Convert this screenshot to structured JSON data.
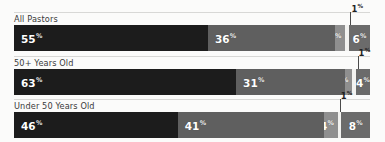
{
  "chart_data": {
    "type": "bar",
    "orientation": "horizontal",
    "stacked": true,
    "normalized": true,
    "title": "",
    "subtitle": "",
    "xlabel": "",
    "ylabel": "",
    "xlim": [
      0,
      100
    ],
    "grid": false,
    "legend": null,
    "legend_position": "none",
    "categories": [
      "All Pastors",
      "50+ Years Old",
      "Under 50 Years Old"
    ],
    "series": [
      {
        "name": "segment-1",
        "values": [
          55,
          63,
          46
        ],
        "color": "#1c1c1c"
      },
      {
        "name": "segment-2",
        "values": [
          36,
          31,
          41
        ],
        "color": "#5f5f5f"
      },
      {
        "name": "segment-3",
        "values": [
          3,
          2,
          4
        ],
        "color": "#8f8f8f"
      },
      {
        "name": "segment-4",
        "values": [
          1,
          1,
          1
        ],
        "color": "#f2f2f0"
      },
      {
        "name": "segment-5",
        "values": [
          6,
          4,
          8
        ],
        "color": "#6b6b6b"
      }
    ],
    "annotations": [
      {
        "row": 0,
        "text": "1",
        "suffix": "%",
        "points_to": "segment-4"
      },
      {
        "row": 1,
        "text": "1",
        "suffix": "%",
        "points_to": "segment-4"
      },
      {
        "row": 2,
        "text": "1",
        "suffix": "%",
        "points_to": "segment-4"
      }
    ]
  },
  "rows": [
    {
      "label": "All Pastors",
      "segments": [
        {
          "name": "segment-1",
          "value": 55,
          "text": "55",
          "suffix": "%",
          "color": "#1c1c1c",
          "show_label": true,
          "align": "lbl-left"
        },
        {
          "name": "segment-2",
          "value": 36,
          "text": "36",
          "suffix": "%",
          "color": "#5f5f5f",
          "show_label": true,
          "align": "lbl-left"
        },
        {
          "name": "segment-3",
          "value": 3,
          "text": "3",
          "suffix": "%",
          "color": "#8f8f8f",
          "show_label": true,
          "align": "lbl-right"
        },
        {
          "name": "segment-4",
          "value": 1,
          "text": "1",
          "suffix": "%",
          "color": "#f2f2f0",
          "show_label": false,
          "align": "lbl-center"
        },
        {
          "name": "segment-5",
          "value": 6,
          "text": "6",
          "suffix": "%",
          "color": "#6b6b6b",
          "show_label": true,
          "align": "lbl-center"
        }
      ],
      "callout": {
        "text": "1",
        "suffix": "%"
      }
    },
    {
      "label": "50+ Years Old",
      "segments": [
        {
          "name": "segment-1",
          "value": 63,
          "text": "63",
          "suffix": "%",
          "color": "#1c1c1c",
          "show_label": true,
          "align": "lbl-left"
        },
        {
          "name": "segment-2",
          "value": 31,
          "text": "31",
          "suffix": "%",
          "color": "#5f5f5f",
          "show_label": true,
          "align": "lbl-left"
        },
        {
          "name": "segment-3",
          "value": 2,
          "text": "2",
          "suffix": "%",
          "color": "#8f8f8f",
          "show_label": true,
          "align": "lbl-right"
        },
        {
          "name": "segment-4",
          "value": 1,
          "text": "1",
          "suffix": "%",
          "color": "#f2f2f0",
          "show_label": false,
          "align": "lbl-center"
        },
        {
          "name": "segment-5",
          "value": 4,
          "text": "4",
          "suffix": "%",
          "color": "#6b6b6b",
          "show_label": true,
          "align": "lbl-center"
        }
      ],
      "callout": {
        "text": "1",
        "suffix": "%"
      }
    },
    {
      "label": "Under 50 Years Old",
      "segments": [
        {
          "name": "segment-1",
          "value": 46,
          "text": "46",
          "suffix": "%",
          "color": "#1c1c1c",
          "show_label": true,
          "align": "lbl-left"
        },
        {
          "name": "segment-2",
          "value": 41,
          "text": "41",
          "suffix": "%",
          "color": "#5f5f5f",
          "show_label": true,
          "align": "lbl-left"
        },
        {
          "name": "segment-3",
          "value": 4,
          "text": "4",
          "suffix": "%",
          "color": "#8f8f8f",
          "show_label": true,
          "align": "lbl-right"
        },
        {
          "name": "segment-4",
          "value": 1,
          "text": "1",
          "suffix": "%",
          "color": "#f2f2f0",
          "show_label": false,
          "align": "lbl-center"
        },
        {
          "name": "segment-5",
          "value": 8,
          "text": "8",
          "suffix": "%",
          "color": "#6b6b6b",
          "show_label": true,
          "align": "lbl-center"
        }
      ],
      "callout": {
        "text": "1",
        "suffix": "%"
      }
    }
  ]
}
